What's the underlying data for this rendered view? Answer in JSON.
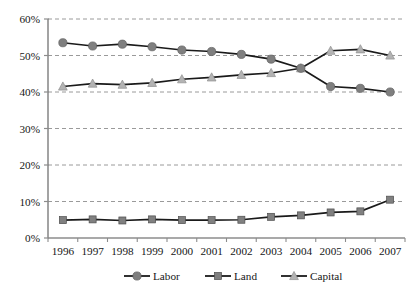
{
  "chart_data": {
    "type": "line",
    "title": "",
    "subtitle": "",
    "xlabel": "",
    "ylabel": "",
    "categories": [
      "1996",
      "1997",
      "1998",
      "1999",
      "2000",
      "2001",
      "2002",
      "2003",
      "2004",
      "2005",
      "2006",
      "2007"
    ],
    "ylim": [
      0,
      60
    ],
    "ytick_values": [
      0,
      10,
      20,
      30,
      40,
      50,
      60
    ],
    "ytick_labels": [
      "0%",
      "10%",
      "20%",
      "30%",
      "40%",
      "50%",
      "60%"
    ],
    "grid": "horizontal-dashed",
    "legend_position": "bottom",
    "series": [
      {
        "name": "Labor",
        "marker": "circle",
        "color": "#7f7f7f",
        "line_color": "#1a1a1a",
        "values": [
          53.5,
          52.6,
          53.1,
          52.4,
          51.5,
          51.1,
          50.3,
          49.0,
          46.5,
          41.5,
          41.0,
          40.0
        ]
      },
      {
        "name": "Land",
        "marker": "square",
        "color": "#808080",
        "line_color": "#1a1a1a",
        "values": [
          4.9,
          5.1,
          4.8,
          5.1,
          4.9,
          4.9,
          5.0,
          5.8,
          6.2,
          7.0,
          7.3,
          10.5
        ]
      },
      {
        "name": "Capital",
        "marker": "triangle",
        "color": "#b3b3b3",
        "line_color": "#1a1a1a",
        "values": [
          41.5,
          42.3,
          42.0,
          42.5,
          43.5,
          44.0,
          44.7,
          45.2,
          46.5,
          51.3,
          51.7,
          50.0
        ]
      }
    ]
  },
  "axis": {
    "y_axis_name": "percent-axis",
    "x_axis_name": "year-axis"
  },
  "colors": {
    "gridline": "#9a9a9a",
    "axis": "#8c8c8c",
    "line": "#1a1a1a",
    "labor_marker": "#7f7f7f",
    "land_marker": "#808080",
    "capital_marker": "#b3b3b3",
    "text": "#161616",
    "background": "#ffffff"
  }
}
